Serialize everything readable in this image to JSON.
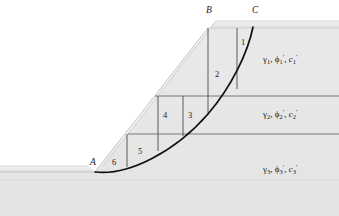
{
  "figure": {
    "background_color": "#ffffff",
    "fill_color": "#e6e6e6",
    "line_color": "#4a4a4a",
    "arc_color": "#1a1a1a"
  },
  "points": [
    {
      "name": "point-a",
      "label": "A",
      "x": 93,
      "y": 164
    },
    {
      "name": "point-b",
      "label": "B",
      "x": 209,
      "y": 12
    },
    {
      "name": "point-c",
      "label": "C",
      "x": 255,
      "y": 12
    }
  ],
  "slices": [
    {
      "number": "1",
      "x": 243,
      "y": 43
    },
    {
      "number": "2",
      "x": 217,
      "y": 75
    },
    {
      "number": "3",
      "x": 190,
      "y": 116
    },
    {
      "number": "4",
      "x": 165,
      "y": 116
    },
    {
      "number": "5",
      "x": 140,
      "y": 152
    },
    {
      "number": "6",
      "x": 114,
      "y": 163
    }
  ],
  "soil_layers": [
    {
      "name": "soil-layer-1",
      "gamma": "γ",
      "gamma_sub": "1",
      "phi": "ϕ",
      "phi_sub": "1",
      "phi_prime": "′",
      "c": "c",
      "c_sub": "1",
      "c_prime": "′",
      "text": "γ1, ϕ′1, c′1",
      "x": 263,
      "y": 60
    },
    {
      "name": "soil-layer-2",
      "gamma": "γ",
      "gamma_sub": "2",
      "phi": "ϕ",
      "phi_sub": "2",
      "phi_prime": "′",
      "c": "c",
      "c_sub": "2",
      "c_prime": "′",
      "text": "γ2, ϕ′2, c′2",
      "x": 263,
      "y": 115
    },
    {
      "name": "soil-layer-3",
      "gamma": "γ",
      "gamma_sub": "3",
      "phi": "ϕ",
      "phi_sub": "3",
      "phi_prime": "′",
      "c": "c",
      "c_sub": "3",
      "c_prime": "′",
      "text": "γ3, ϕ′3, c′3",
      "x": 263,
      "y": 170
    }
  ],
  "geometry": {
    "crest_y": 28,
    "toe_y": 172,
    "crest_x": 208,
    "toe_x": 95,
    "layer_boundary_1_y": 96,
    "layer_boundary_2_y": 134,
    "slice_lines_x": [
      127,
      158,
      183,
      208,
      237
    ],
    "arc_start": "A",
    "arc_end": "C"
  }
}
